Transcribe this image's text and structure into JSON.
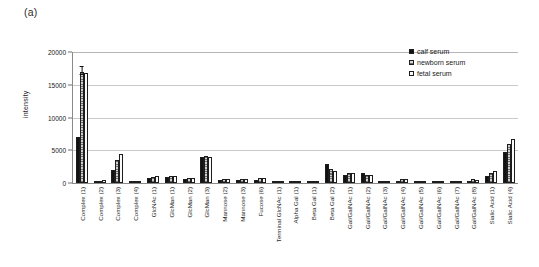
{
  "panel": {
    "label": "(a)"
  },
  "legend": {
    "items": [
      {
        "name": "calf serum",
        "key": "calf"
      },
      {
        "name": "newborn serum",
        "key": "newborn"
      },
      {
        "name": "fetal serum",
        "key": "fetal"
      }
    ]
  },
  "axis": {
    "y_label": "intensity",
    "y_ticks": [
      0,
      5000,
      10000,
      15000,
      20000
    ]
  },
  "chart_data": {
    "type": "bar",
    "title": "",
    "xlabel": "",
    "ylabel": "intensity",
    "ylim": [
      0,
      20000
    ],
    "grid": true,
    "legend_position": "top-right",
    "categories": [
      "Complex (1)",
      "Complex (2)",
      "Complex (3)",
      "Complex (4)",
      "GlcNAc (1)",
      "GlcMan (1)",
      "GlcMan (2)",
      "GlcMan (3)",
      "Mannose (2)",
      "Mannose (3)",
      "Fucose (6)",
      "Terminal GlcNAc (1)",
      "Alpha Gal (1)",
      "Beta Gal (1)",
      "Beta Gal (2)",
      "Gal/GalNAc (1)",
      "Gal/GalNAc (2)",
      "Gal/GalNAc (3)",
      "Gal/GalNAc (4)",
      "Gal/GalNAc (5)",
      "Gal/GalNAc (6)",
      "Gal/GalNAc (7)",
      "Gal/GalNAc (8)",
      "Sialic Acid (1)",
      "Sialic Acid (4)"
    ],
    "series": [
      {
        "name": "calf serum",
        "values": [
          7000,
          300,
          2000,
          120,
          700,
          900,
          550,
          3900,
          500,
          450,
          450,
          180,
          130,
          200,
          2900,
          1300,
          1500,
          150,
          300,
          80,
          70,
          60,
          200,
          1100,
          4700
        ]
      },
      {
        "name": "newborn serum",
        "values": [
          17000,
          350,
          3500,
          150,
          900,
          1100,
          800,
          4100,
          650,
          550,
          700,
          200,
          150,
          230,
          2200,
          1600,
          1300,
          180,
          600,
          90,
          80,
          70,
          550,
          1500,
          6000
        ]
      },
      {
        "name": "fetal serum",
        "values": [
          16800,
          400,
          4500,
          170,
          1100,
          1000,
          700,
          3950,
          600,
          600,
          750,
          210,
          160,
          240,
          1900,
          1500,
          1250,
          200,
          550,
          100,
          90,
          80,
          400,
          1900,
          6700
        ]
      }
    ],
    "error_bars": {
      "Complex (1)": {
        "newborn serum": 700
      }
    }
  }
}
